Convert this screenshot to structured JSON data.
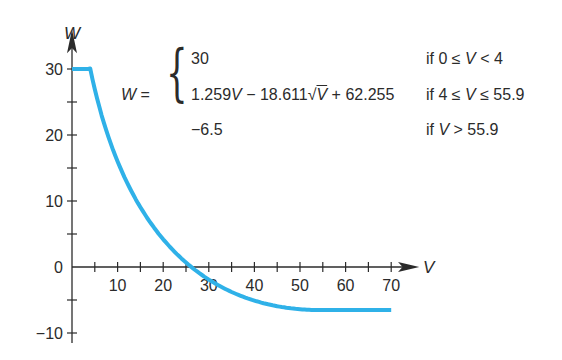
{
  "chart_data": {
    "type": "line",
    "title": "",
    "xlabel": "V",
    "ylabel": "W",
    "xlim": [
      0,
      75
    ],
    "ylim": [
      -11,
      33
    ],
    "x_ticks": [
      5,
      10,
      15,
      20,
      25,
      30,
      35,
      40,
      45,
      50,
      55,
      60,
      65,
      70
    ],
    "x_tick_labels": [
      "10",
      "20",
      "30",
      "40",
      "50",
      "60",
      "70"
    ],
    "x_labeled_ticks": [
      10,
      20,
      30,
      40,
      50,
      60,
      70
    ],
    "y_ticks": [
      -10,
      -5,
      0,
      5,
      10,
      15,
      20,
      25,
      30
    ],
    "y_tick_labels": [
      "−10",
      "0",
      "10",
      "20",
      "30"
    ],
    "y_labeled_ticks": [
      -10,
      0,
      10,
      20,
      30
    ],
    "grid": false,
    "line_color": "#2fb1e8",
    "series": [
      {
        "name": "W(V)",
        "piecewise": [
          {
            "expr": "30",
            "condition": "if 0 ≤ V < 4"
          },
          {
            "expr": "1.259V − 18.611√V + 62.255",
            "condition": "if 4 ≤ V ≤ 55.9"
          },
          {
            "expr": "−6.5",
            "condition": "if V > 55.9"
          }
        ],
        "x": [
          0,
          4,
          6,
          8,
          10,
          12,
          15,
          18,
          20,
          22,
          25,
          28,
          30,
          33,
          36,
          40,
          45,
          50,
          55.9,
          60,
          65,
          70
        ],
        "values": [
          30,
          30,
          24.2,
          19.7,
          15.9,
          12.9,
          8.9,
          5.9,
          4.2,
          2.7,
          0.7,
          -1.0,
          -2.0,
          -3.3,
          -4.3,
          -5.3,
          -6.1,
          -6.4,
          -6.5,
          -6.5,
          -6.5,
          -6.5
        ]
      }
    ]
  },
  "equation": {
    "lhs": "W =",
    "cases": [
      {
        "expr": "30",
        "cond": "if 0 ≤ V < 4"
      },
      {
        "expr": "1.259V − 18.611√V + 62.255",
        "cond": "if 4 ≤ V ≤ 55.9"
      },
      {
        "expr": "−6.5",
        "cond": "if V > 55.9"
      }
    ]
  }
}
